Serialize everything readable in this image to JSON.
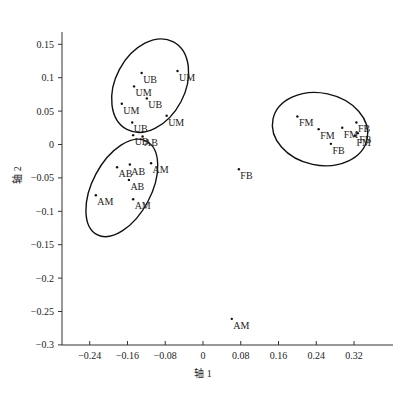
{
  "chart_data": {
    "type": "scatter",
    "title": "",
    "xlabel": "轴 1",
    "ylabel": "轴 2",
    "xlim": [
      -0.3,
      0.4
    ],
    "ylim": [
      -0.3,
      0.18
    ],
    "grid": false,
    "legend": null,
    "x_ticks": [
      -0.24,
      -0.16,
      -0.08,
      0,
      0.08,
      0.16,
      0.24,
      0.32
    ],
    "x_tick_labels": [
      "-0.24",
      "-0.16",
      "-0.08",
      "0",
      "0.08",
      "0.16",
      "0.24",
      "0.32"
    ],
    "y_ticks": [
      0.15,
      0.1,
      0.05,
      0,
      -0.05,
      -0.1,
      -0.15,
      -0.2,
      -0.25,
      -0.3
    ],
    "y_tick_labels": [
      "0.15",
      "0.1",
      "0.05",
      "0",
      "-0.05",
      "-0.1",
      "-0.15",
      "-0.2",
      "-0.25",
      "-0.3"
    ],
    "points": [
      {
        "label": "UB",
        "x": -0.13,
        "y": 0.107
      },
      {
        "label": "UM",
        "x": -0.054,
        "y": 0.11
      },
      {
        "label": "UM",
        "x": -0.146,
        "y": 0.087
      },
      {
        "label": "UB",
        "x": -0.119,
        "y": 0.069
      },
      {
        "label": "UM",
        "x": -0.172,
        "y": 0.061
      },
      {
        "label": "UM",
        "x": -0.077,
        "y": 0.043
      },
      {
        "label": "UB",
        "x": -0.15,
        "y": 0.033
      },
      {
        "label": "UB",
        "x": -0.148,
        "y": 0.014
      },
      {
        "label": "AB",
        "x": -0.128,
        "y": 0.012
      },
      {
        "label": "AB",
        "x": -0.182,
        "y": -0.034
      },
      {
        "label": "AB",
        "x": -0.155,
        "y": -0.03
      },
      {
        "label": "AM",
        "x": -0.11,
        "y": -0.028
      },
      {
        "label": "AB",
        "x": -0.157,
        "y": -0.053
      },
      {
        "label": "AM",
        "x": -0.227,
        "y": -0.076
      },
      {
        "label": "AM",
        "x": -0.148,
        "y": -0.082
      },
      {
        "label": "FB",
        "x": 0.076,
        "y": -0.037
      },
      {
        "label": "AM",
        "x": 0.061,
        "y": -0.261
      },
      {
        "label": "FM",
        "x": 0.2,
        "y": 0.042
      },
      {
        "label": "FM",
        "x": 0.245,
        "y": 0.023
      },
      {
        "label": "FB",
        "x": 0.271,
        "y": 0.001
      },
      {
        "label": "FM",
        "x": 0.295,
        "y": 0.025
      },
      {
        "label": "FB",
        "x": 0.325,
        "y": 0.033
      },
      {
        "label": "FB",
        "x": 0.328,
        "y": 0.017
      },
      {
        "label": "FM",
        "x": 0.322,
        "y": 0.013
      }
    ],
    "ellipses": [
      {
        "name": "U-group",
        "cx": -0.112,
        "cy": 0.088,
        "rx": 0.105,
        "ry": 0.052,
        "rotation_deg": -62
      },
      {
        "name": "A-group",
        "cx": -0.172,
        "cy": -0.065,
        "rx": 0.112,
        "ry": 0.044,
        "rotation_deg": -62
      },
      {
        "name": "F-group",
        "cx": 0.248,
        "cy": 0.023,
        "rx": 0.102,
        "ry": 0.054,
        "rotation_deg": 12
      }
    ]
  },
  "style": {
    "axis_color": "#333333",
    "point_color": "#111111",
    "ellipse_color": "#111111"
  }
}
